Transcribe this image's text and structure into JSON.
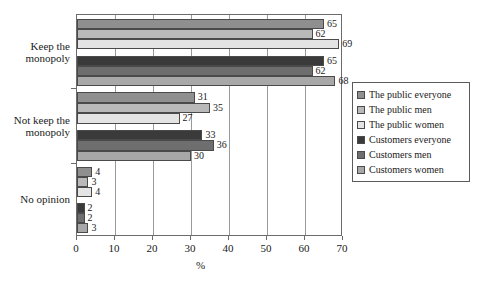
{
  "chart_data": {
    "type": "bar",
    "orientation": "horizontal",
    "title": "",
    "xlabel": "%",
    "ylabel": "",
    "xlim": [
      0,
      70
    ],
    "xticks": [
      0,
      10,
      20,
      30,
      40,
      50,
      60,
      70
    ],
    "grid": true,
    "grid_axis": "x",
    "legend_position": "right",
    "categories": [
      "Keep the\nmonopoly",
      "Not keep the\nmonopoly",
      "No opinion"
    ],
    "series": [
      {
        "name": "The public everyone",
        "color": "#8f8f8f",
        "values": [
          65,
          31,
          4
        ]
      },
      {
        "name": "The public men",
        "color": "#b9b9b9",
        "values": [
          62,
          35,
          3
        ]
      },
      {
        "name": "The public women",
        "color": "#e4e4e4",
        "values": [
          69,
          27,
          4
        ]
      },
      {
        "name": "Customers everyone",
        "color": "#3a3a3a",
        "values": [
          65,
          33,
          2
        ]
      },
      {
        "name": "Customers men",
        "color": "#6e6e6e",
        "values": [
          62,
          36,
          2
        ]
      },
      {
        "name": "Customers women",
        "color": "#a8a8a8",
        "values": [
          68,
          30,
          3
        ]
      }
    ]
  },
  "axis": {
    "x_tick_labels": [
      "0",
      "10",
      "20",
      "30",
      "40",
      "50",
      "60",
      "70"
    ],
    "x_title": "%"
  },
  "legend": {
    "items": [
      {
        "label": "The public everyone"
      },
      {
        "label": "The public men"
      },
      {
        "label": "The public women"
      },
      {
        "label": "Customers everyone"
      },
      {
        "label": "Customers men"
      },
      {
        "label": "Customers women"
      }
    ]
  },
  "category_labels": [
    {
      "line1": "Keep the",
      "line2": "monopoly"
    },
    {
      "line1": "Not keep the",
      "line2": "monopoly"
    },
    {
      "line1": "No opinion",
      "line2": ""
    }
  ]
}
